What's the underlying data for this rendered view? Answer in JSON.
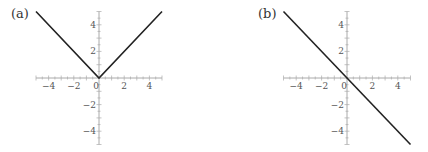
{
  "chart_data": [
    {
      "type": "line",
      "panel_label": "(a)",
      "function": "y = |x|",
      "x": [
        -5,
        0,
        5
      ],
      "y": [
        5,
        0,
        5
      ],
      "xlim": [
        -5,
        5
      ],
      "ylim": [
        -5,
        5
      ],
      "xticks": [
        "-4",
        "-2",
        "0",
        "2",
        "4"
      ],
      "yticks": [
        "4",
        "2",
        "-2",
        "-4"
      ],
      "grid": false,
      "xlabel": "",
      "ylabel": ""
    },
    {
      "type": "line",
      "panel_label": "(b)",
      "function": "y = -x",
      "x": [
        -5,
        5
      ],
      "y": [
        5,
        -5
      ],
      "xlim": [
        -5,
        5
      ],
      "ylim": [
        -5,
        5
      ],
      "xticks": [
        "-4",
        "-2",
        "0",
        "2",
        "4"
      ],
      "yticks": [
        "4",
        "2",
        "-2",
        "-4"
      ],
      "grid": false,
      "xlabel": "",
      "ylabel": ""
    }
  ],
  "colors": {
    "line": "#222222",
    "axis": "#aaaaaa",
    "tick_text": "#555555"
  }
}
